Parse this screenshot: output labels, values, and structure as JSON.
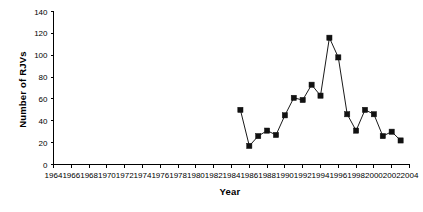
{
  "chart_data": {
    "type": "line",
    "title": "",
    "xlabel": "Year",
    "ylabel": "Number of RJVs",
    "xlim": [
      1964,
      2004
    ],
    "ylim": [
      0,
      140
    ],
    "xticks": [
      1964,
      1966,
      1968,
      1970,
      1972,
      1974,
      1976,
      1978,
      1980,
      1982,
      1984,
      1986,
      1988,
      1990,
      1992,
      1994,
      1996,
      1998,
      2000,
      2002,
      2004
    ],
    "yticks": [
      0,
      20,
      40,
      60,
      80,
      100,
      120,
      140
    ],
    "grid": false,
    "legend": null,
    "marker": "filled-square",
    "x": [
      1985,
      1986,
      1987,
      1988,
      1989,
      1990,
      1991,
      1992,
      1993,
      1994,
      1995,
      1996,
      1997,
      1998,
      1999,
      2000,
      2001,
      2002,
      2003
    ],
    "values": [
      50,
      17,
      26,
      31,
      27,
      45,
      61,
      59,
      73,
      63,
      116,
      98,
      46,
      31,
      50,
      46,
      26,
      30,
      22
    ],
    "series": [
      {
        "name": "Number of RJVs",
        "x": [
          1985,
          1986,
          1987,
          1988,
          1989,
          1990,
          1991,
          1992,
          1993,
          1994,
          1995,
          1996,
          1997,
          1998,
          1999,
          2000,
          2001,
          2002,
          2003
        ],
        "values": [
          50,
          17,
          26,
          31,
          27,
          45,
          61,
          59,
          73,
          63,
          116,
          98,
          46,
          31,
          50,
          46,
          26,
          30,
          22
        ]
      }
    ]
  },
  "colors": {
    "axis": "#000000",
    "line": "#1a1a1a",
    "marker": "#111111",
    "background": "#ffffff"
  }
}
